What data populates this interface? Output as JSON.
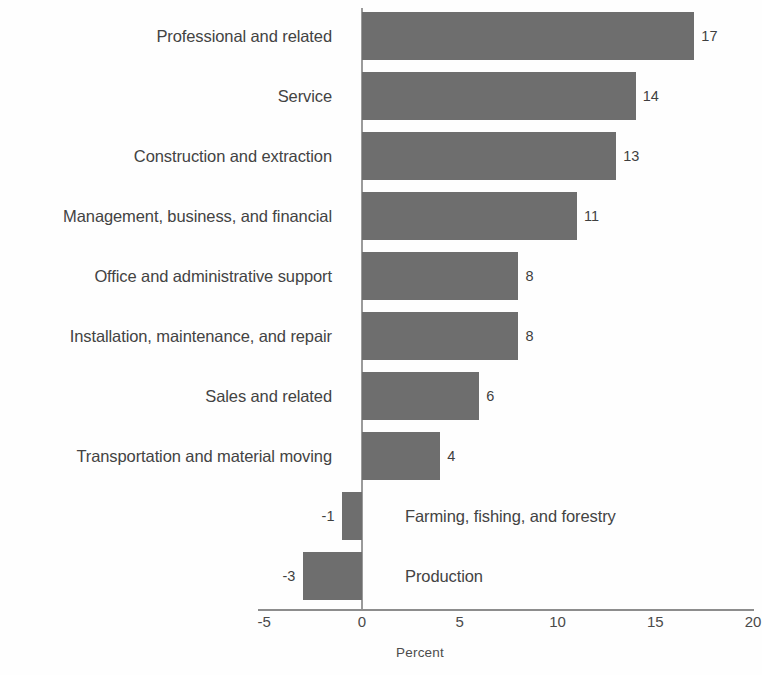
{
  "chart_data": {
    "type": "bar",
    "orientation": "horizontal",
    "title": "",
    "subtitle": "",
    "xlabel": "Percent",
    "ylabel": "",
    "categories": [
      "Professional and related",
      "Service",
      "Construction and extraction",
      "Management, business, and financial",
      "Office and administrative support",
      "Installation, maintenance, and repair",
      "Sales and related",
      "Transportation and material moving",
      "Farming, fishing, and forestry",
      "Production"
    ],
    "values": [
      17,
      14,
      13,
      11,
      8,
      8,
      6,
      4,
      -1,
      -3
    ],
    "value_labels": [
      "17",
      "14",
      "13",
      "11",
      "8",
      "8",
      "6",
      "4",
      "-1",
      "-3"
    ],
    "xlim": [
      -5,
      20
    ],
    "xticks": [
      -5,
      0,
      5,
      10,
      15,
      20
    ],
    "xtick_labels": [
      "-5",
      "0",
      "5",
      "10",
      "15",
      "20"
    ],
    "grid": false,
    "legend": false,
    "bar_color": "#6e6e6e",
    "axis_color": "#8d8d8d",
    "background_color": "#fefefe",
    "text_color": "#434343"
  },
  "axis": {
    "xlabel": "Percent"
  },
  "rows": [
    {
      "label": "Professional and related",
      "value_label": "17"
    },
    {
      "label": "Service",
      "value_label": "14"
    },
    {
      "label": "Construction and extraction",
      "value_label": "13"
    },
    {
      "label": "Management, business, and financial",
      "value_label": "11"
    },
    {
      "label": "Office and administrative support",
      "value_label": "8"
    },
    {
      "label": "Installation, maintenance, and repair",
      "value_label": "8"
    },
    {
      "label": "Sales and related",
      "value_label": "6"
    },
    {
      "label": "Transportation and material moving",
      "value_label": "4"
    },
    {
      "label": "Farming, fishing, and forestry",
      "value_label": "-1"
    },
    {
      "label": "Production",
      "value_label": "-3"
    }
  ],
  "ticks": [
    {
      "label": "-5"
    },
    {
      "label": "0"
    },
    {
      "label": "5"
    },
    {
      "label": "10"
    },
    {
      "label": "15"
    },
    {
      "label": "20"
    }
  ]
}
